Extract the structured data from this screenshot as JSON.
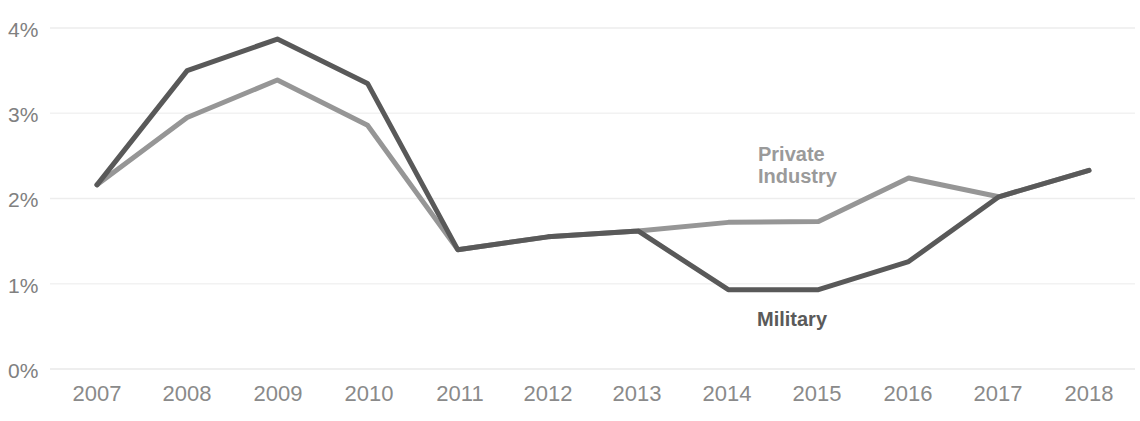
{
  "chart_data": {
    "type": "line",
    "title": "",
    "subtitle": "",
    "xlabel": "",
    "ylabel": "",
    "categories": [
      "2007",
      "2008",
      "2009",
      "2010",
      "2011",
      "2012",
      "2013",
      "2014",
      "2015",
      "2016",
      "2017",
      "2018"
    ],
    "x": [
      2007,
      2008,
      2009,
      2010,
      2011,
      2012,
      2013,
      2014,
      2015,
      2016,
      2017,
      2018
    ],
    "ylim": [
      0,
      4
    ],
    "ytick_labels": [
      "0%",
      "1%",
      "2%",
      "3%",
      "4%"
    ],
    "ytick_values": [
      0,
      1,
      2,
      3,
      4
    ],
    "grid": true,
    "grid_axis": "y",
    "legend_position": "inline-annotations",
    "series": [
      {
        "name": "Military",
        "color": "#595959",
        "values": [
          2.16,
          3.5,
          3.87,
          3.35,
          1.4,
          1.55,
          1.62,
          0.93,
          0.93,
          1.26,
          2.02,
          2.33
        ]
      },
      {
        "name": "Private Industry",
        "color": "#969696",
        "values": [
          2.16,
          2.95,
          3.39,
          2.86,
          1.4,
          1.55,
          1.62,
          1.72,
          1.73,
          2.24,
          2.02,
          2.33
        ]
      }
    ],
    "annotations": [
      {
        "text": "Private\nIndustry",
        "series": "Private Industry",
        "color": "#9a9a9a"
      },
      {
        "text": "Military",
        "series": "Military",
        "color": "#5a5a5a"
      }
    ]
  },
  "axes": {
    "y_labels": [
      "4%",
      "3%",
      "2%",
      "1%",
      "0%"
    ],
    "x_labels": [
      "2007",
      "2008",
      "2009",
      "2010",
      "2011",
      "2012",
      "2013",
      "2014",
      "2015",
      "2016",
      "2017",
      "2018"
    ]
  },
  "annotations": {
    "private_industry": "Private\nIndustry",
    "military": "Military"
  },
  "colors": {
    "military_line": "#595959",
    "private_industry_line": "#969696",
    "gridline": "#ededed",
    "axis_text": "#8a8a8a"
  }
}
